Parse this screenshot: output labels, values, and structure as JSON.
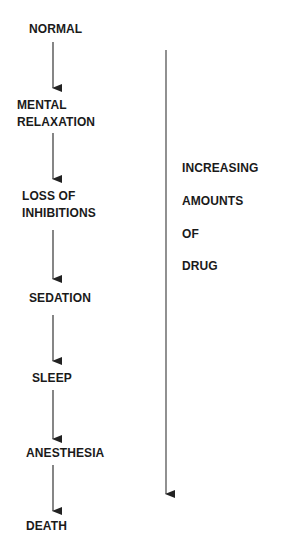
{
  "diagram": {
    "stages": [
      {
        "label": "NORMAL"
      },
      {
        "label_line1": "MENTAL",
        "label_line2": "RELAXATION"
      },
      {
        "label_line1": "LOSS OF",
        "label_line2": "INHIBITIONS"
      },
      {
        "label": "SEDATION"
      },
      {
        "label": "SLEEP"
      },
      {
        "label": "ANESTHESIA"
      },
      {
        "label": "DEATH"
      }
    ],
    "side_label": {
      "line1": "INCREASING",
      "line2": "AMOUNTS",
      "line3": "OF",
      "line4": "DRUG"
    },
    "colors": {
      "text": "#1a1a1a",
      "arrow": "#333333"
    }
  }
}
